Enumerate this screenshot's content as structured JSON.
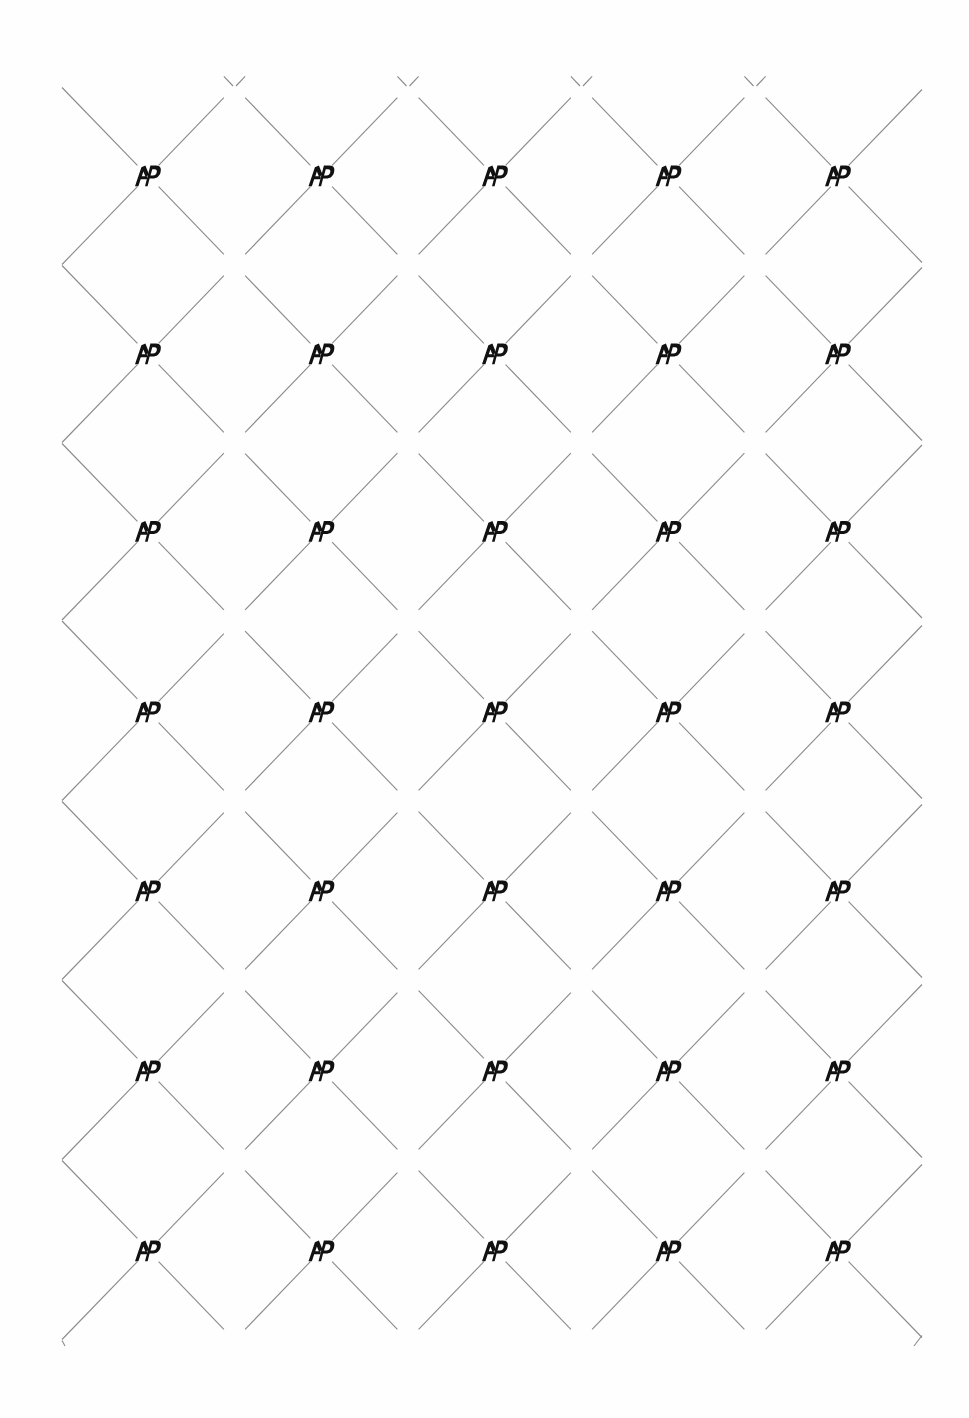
{
  "document": {
    "kind": "security-watermark-sheet",
    "title": "AP Monogram Diamond Lattice Watermark",
    "canvas_width": 969,
    "canvas_height": 1418,
    "background_color": "#fefefe"
  },
  "pattern": {
    "name": "diagonal-diamond-lattice",
    "line_color": "#8a8a8a",
    "line_width": 1.1,
    "line_angle_degrees": 45,
    "node_gap_radius": 15,
    "bounds": {
      "left": 62,
      "top": 86,
      "right": 922,
      "bottom": 1346
    },
    "cell_half_width": 86.5,
    "cell_half_height": 89,
    "description": "Lines at plus and minus 45 degrees crossing to form a field of diamonds, with a small blank gap at every crossing point."
  },
  "logo": {
    "name": "ap-monogram",
    "glyph_label": "AP",
    "color": "#111111",
    "width": 26,
    "height": 21,
    "columns": [
      148,
      321.5,
      495,
      668.5,
      838
    ],
    "rows": [
      176,
      354,
      531.5,
      712,
      891,
      1071,
      1251
    ],
    "count": 35,
    "placement": "at every primary lattice intersection; secondary half-offset intersections are left blank"
  },
  "grid": {
    "column_count": 5,
    "row_count": 7,
    "column_spacing": 173,
    "row_spacing": 178.5
  }
}
